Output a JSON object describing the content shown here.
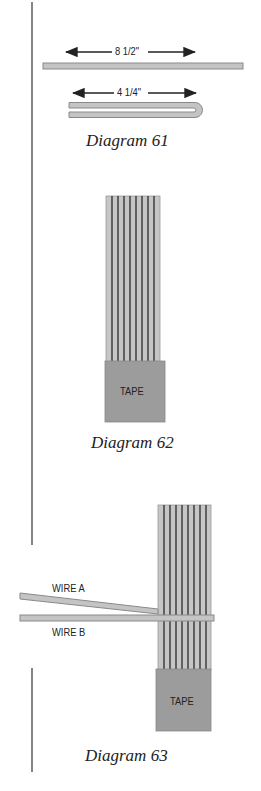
{
  "diagrams": [
    {
      "caption": "Diagram 61",
      "measure_full": "8 1/2\"",
      "measure_half": "4 1/4\""
    },
    {
      "caption": "Diagram 62",
      "tape_label": "TAPE"
    },
    {
      "caption": "Diagram 63",
      "tape_label": "TAPE",
      "wire_a_label": "WIRE A",
      "wire_b_label": "WIRE B"
    }
  ],
  "colors": {
    "wire_fill": "#c4c4c4",
    "wire_stroke": "#8a8a8a",
    "strand_line": "#2a2a2a",
    "tape_fill": "#9a9a9a",
    "margin_line": "#333333"
  }
}
